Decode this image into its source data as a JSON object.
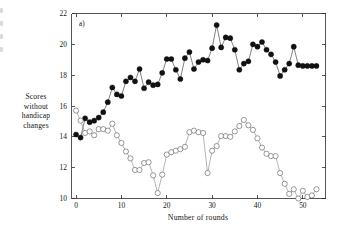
{
  "figure": {
    "panel_label": "a)",
    "axis_color": "#2b2b2b",
    "background": "#ffffff"
  },
  "ylabel_lines": [
    "Scores",
    "without",
    "handicap",
    "changes"
  ],
  "chart_data": {
    "type": "line",
    "title": "",
    "subtitle": "",
    "panel_label": "a)",
    "xlabel": "Number of rounds",
    "ylabel": "Scores without handicap changes",
    "xlim": [
      -1,
      55
    ],
    "ylim": [
      10,
      22
    ],
    "xticks": [
      0,
      10,
      20,
      30,
      40,
      50
    ],
    "yticks": [
      10,
      12,
      14,
      16,
      18,
      20,
      22
    ],
    "xtick_labels": [
      "0",
      "10",
      "20",
      "30",
      "40",
      "50"
    ],
    "ytick_labels": [
      "10",
      "12",
      "14",
      "16",
      "18",
      "20",
      "22"
    ],
    "grid": false,
    "legend": null,
    "legend_position": "none",
    "marker_size": 2.6,
    "series": [
      {
        "name": "filled-series",
        "marker": "filled-circle",
        "marker_fill": "#111111",
        "marker_edge": "#111111",
        "line_color": "#3d3d3d",
        "x": [
          0,
          1,
          2,
          3,
          4,
          5,
          6,
          7,
          8,
          9,
          10,
          11,
          12,
          13,
          14,
          15,
          16,
          17,
          18,
          19,
          20,
          21,
          22,
          23,
          24,
          25,
          26,
          27,
          28,
          29,
          30,
          31,
          32,
          33,
          34,
          35,
          36,
          37,
          38,
          39,
          40,
          41,
          42,
          43,
          44,
          45,
          46,
          47,
          48,
          49,
          50,
          51,
          52,
          53
        ],
        "values": [
          14.15,
          13.95,
          15.2,
          14.95,
          15.05,
          15.25,
          15.6,
          16.25,
          17.2,
          16.75,
          16.65,
          17.6,
          17.85,
          17.6,
          18.4,
          17.15,
          17.55,
          17.35,
          17.4,
          18.15,
          19.05,
          19.05,
          18.35,
          17.75,
          19.1,
          19.5,
          18.4,
          18.85,
          19.0,
          18.95,
          19.75,
          21.25,
          19.8,
          20.45,
          20.4,
          19.65,
          18.35,
          18.75,
          18.9,
          20.0,
          19.85,
          20.15,
          19.65,
          19.35,
          18.85,
          17.95,
          18.35,
          18.75,
          19.85,
          18.65,
          18.6,
          18.6,
          18.6,
          18.6
        ]
      },
      {
        "name": "open-series",
        "marker": "open-circle",
        "marker_fill": "#ffffff",
        "marker_edge": "#555555",
        "line_color": "#8c8c8c",
        "x": [
          0,
          1,
          2,
          3,
          4,
          5,
          6,
          7,
          8,
          9,
          10,
          11,
          12,
          13,
          14,
          15,
          16,
          17,
          18,
          19,
          20,
          21,
          22,
          23,
          24,
          25,
          26,
          27,
          28,
          29,
          30,
          31,
          32,
          33,
          34,
          35,
          36,
          37,
          38,
          39,
          40,
          41,
          42,
          43,
          44,
          45,
          46,
          47,
          48,
          49,
          50,
          51,
          52,
          53
        ],
        "values": [
          15.7,
          15.05,
          14.25,
          14.35,
          14.1,
          14.5,
          14.5,
          14.4,
          14.85,
          14.1,
          13.6,
          13.05,
          12.6,
          11.85,
          11.85,
          12.3,
          12.35,
          11.5,
          10.35,
          11.55,
          12.85,
          13.0,
          13.1,
          13.2,
          13.35,
          14.3,
          14.4,
          14.3,
          14.25,
          11.65,
          13.1,
          13.4,
          14.05,
          14.05,
          14.0,
          14.35,
          14.7,
          15.1,
          14.75,
          14.45,
          13.9,
          13.3,
          12.9,
          12.75,
          12.75,
          11.65,
          10.95,
          10.3,
          10.6,
          10.0,
          10.5,
          10.1,
          10.2,
          10.6
        ]
      }
    ]
  }
}
